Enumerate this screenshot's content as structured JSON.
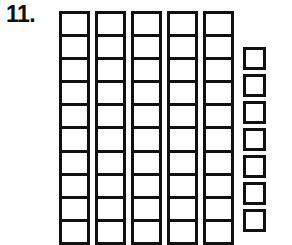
{
  "problem": {
    "number_label": "11.",
    "type": "base-ten-blocks-place-value"
  },
  "blocks": {
    "ink_color": "#111111",
    "paper_color": "#ffffff",
    "tens": {
      "count": 5,
      "units_per_rod": 10,
      "rod_width": 31,
      "rod_top": 11,
      "rod_bottom_cutoff": 242,
      "rod_x_positions": [
        59,
        95,
        131,
        167,
        203
      ],
      "label": "tens rods"
    },
    "ones": {
      "count": 7,
      "square_size": 23,
      "x_position": 243,
      "y_positions": [
        47,
        74,
        101,
        128,
        155,
        182,
        209
      ],
      "label": "unit squares"
    },
    "total_value": 57
  }
}
